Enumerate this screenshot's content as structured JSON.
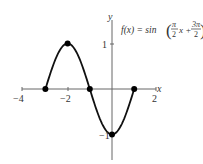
{
  "chart_data": {
    "type": "line",
    "xlabel": "x",
    "ylabel": "y",
    "xlim": [
      -4,
      2
    ],
    "ylim": [
      -1.5,
      1.5
    ],
    "x_ticks": [
      -4,
      -2,
      2
    ],
    "y_ticks": [
      1,
      -1
    ],
    "grid": false,
    "series": [
      {
        "name": "f(x)",
        "domain": [
          -3,
          1
        ],
        "marked_points": [
          {
            "x": -3,
            "y": 0
          },
          {
            "x": -2,
            "y": 1
          },
          {
            "x": -1,
            "y": 0
          },
          {
            "x": 0,
            "y": -1
          },
          {
            "x": 1,
            "y": 0
          }
        ]
      }
    ]
  },
  "labels": {
    "x_axis": "x",
    "y_axis": "y",
    "tick_x_neg4": "−4",
    "tick_x_neg2": "−2",
    "tick_x_2": "2",
    "tick_y_1": "1",
    "tick_y_neg1": "−1",
    "formula_lhs": "f(x) = sin",
    "formula_frac1_num": "π",
    "formula_frac1_den": "2",
    "formula_x": "x +",
    "formula_frac2_num": "3π",
    "formula_frac2_den": "2"
  }
}
